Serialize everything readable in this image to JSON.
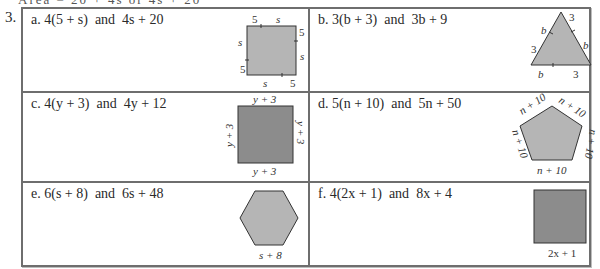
{
  "problem": {
    "number": "3.",
    "top_fragment": "Area  = 20 + 4s  or  4s + 20"
  },
  "colors": {
    "border": "#6e6e6e",
    "shape_light": "#b5b5b5",
    "shape_dark": "#8c8c8c",
    "text": "#2a2a2a"
  },
  "items": [
    {
      "letter": "a.",
      "expr1": "4(5 + s)",
      "conj": "and",
      "expr2": "4s + 20",
      "shape": "square",
      "side_labels": [
        "5",
        "s",
        "5",
        "s",
        "5",
        "s",
        "5",
        "s"
      ]
    },
    {
      "letter": "b.",
      "expr1": "3(b + 3)",
      "conj": "and",
      "expr2": "3b + 9",
      "shape": "triangle",
      "side_labels": [
        "b",
        "3",
        "3",
        "b",
        "b",
        "3"
      ]
    },
    {
      "letter": "c.",
      "expr1": "4(y + 3)",
      "conj": "and",
      "expr2": "4y + 12",
      "shape": "square",
      "side_labels": [
        "y + 3",
        "y + 3",
        "y + 3",
        "y + 3"
      ]
    },
    {
      "letter": "d.",
      "expr1": "5(n + 10)",
      "conj": "and",
      "expr2": "5n + 50",
      "shape": "pentagon",
      "side_labels": [
        "n + 10",
        "n + 10",
        "n + 10",
        "n + 10",
        "n + 10"
      ]
    },
    {
      "letter": "e.",
      "expr1": "6(s + 8)",
      "conj": "and",
      "expr2": "6s + 48",
      "shape": "hexagon",
      "side_labels": [
        "s + 8"
      ]
    },
    {
      "letter": "f.",
      "expr1": "4(2x + 1)",
      "conj": "and",
      "expr2": "8x + 4",
      "shape": "square",
      "side_labels": [
        "2x + 1"
      ]
    }
  ]
}
